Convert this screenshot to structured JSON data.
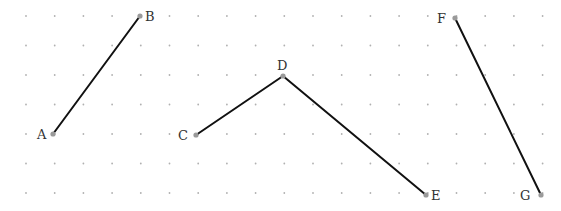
{
  "diagram": {
    "type": "line-segments-on-dot-grid",
    "grid": {
      "x0": 26,
      "dx": 28.7,
      "cols": 19,
      "y0": 16,
      "dy": 29.5,
      "rows": 7,
      "dot_color": "#b0b0b0"
    },
    "line_color": "#111111",
    "point_color": "#9a9a9a",
    "points": [
      {
        "id": "A",
        "label": "A",
        "x": 53,
        "y": 134,
        "lx": 37,
        "ly": 139
      },
      {
        "id": "B",
        "label": "B",
        "x": 140,
        "y": 16,
        "lx": 145,
        "ly": 21
      },
      {
        "id": "C",
        "label": "C",
        "x": 196,
        "y": 135,
        "lx": 178,
        "ly": 140
      },
      {
        "id": "D",
        "label": "D",
        "x": 283,
        "y": 76,
        "lx": 277,
        "ly": 70
      },
      {
        "id": "E",
        "label": "E",
        "x": 426,
        "y": 195,
        "lx": 431,
        "ly": 200
      },
      {
        "id": "F",
        "label": "F",
        "x": 455,
        "y": 18,
        "lx": 437,
        "ly": 23
      },
      {
        "id": "G",
        "label": "G",
        "x": 541,
        "y": 195,
        "lx": 520,
        "ly": 200
      }
    ],
    "segments": [
      {
        "from": "A",
        "to": "B"
      },
      {
        "from": "C",
        "to": "D"
      },
      {
        "from": "D",
        "to": "E"
      },
      {
        "from": "F",
        "to": "G"
      }
    ]
  }
}
